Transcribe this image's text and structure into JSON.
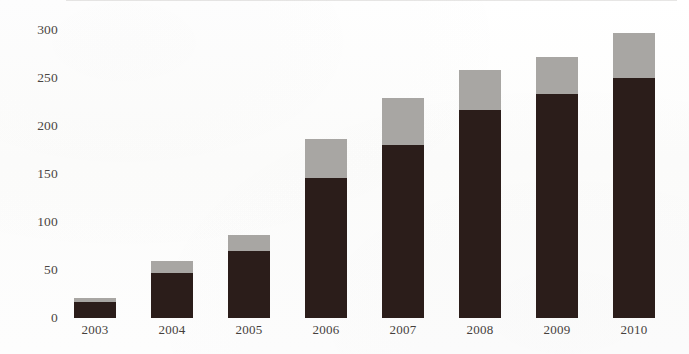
{
  "chart_data": {
    "type": "bar",
    "stacked": true,
    "title": "",
    "subtitle": "",
    "xlabel": "",
    "ylabel": "",
    "categories": [
      "2003",
      "2004",
      "2005",
      "2006",
      "2007",
      "2008",
      "2009",
      "2010"
    ],
    "series": [
      {
        "name": "lower-segment",
        "color": "#2b1d1a",
        "values": [
          17,
          47,
          70,
          146,
          180,
          217,
          233,
          250
        ]
      },
      {
        "name": "upper-segment",
        "color": "#a8a6a3",
        "values": [
          4,
          12,
          16,
          40,
          49,
          41,
          39,
          47
        ]
      }
    ],
    "totals": [
      21,
      59,
      86,
      186,
      229,
      258,
      272,
      297
    ],
    "ylim": [
      0,
      310
    ],
    "yticks": [
      0,
      50,
      100,
      150,
      200,
      250,
      300
    ],
    "ytick_labels": [
      "0",
      "50",
      "100",
      "150",
      "200",
      "250",
      "300"
    ],
    "xtick_labels": [
      "2003",
      "2004",
      "2005",
      "2006",
      "2007",
      "2008",
      "2009",
      "2010"
    ],
    "grid": false,
    "legend": "none"
  },
  "axis": {
    "y_labels": [
      "300",
      "250",
      "200",
      "150",
      "100",
      "50",
      "0"
    ],
    "x_labels": [
      "2003",
      "2004",
      "2005",
      "2006",
      "2007",
      "2008",
      "2009",
      "2010"
    ]
  },
  "colors": {
    "segment_dark": "#2b1d1a",
    "segment_light": "#a8a6a3",
    "background": "#fdfdfc",
    "axis_text": "#4a4542"
  }
}
